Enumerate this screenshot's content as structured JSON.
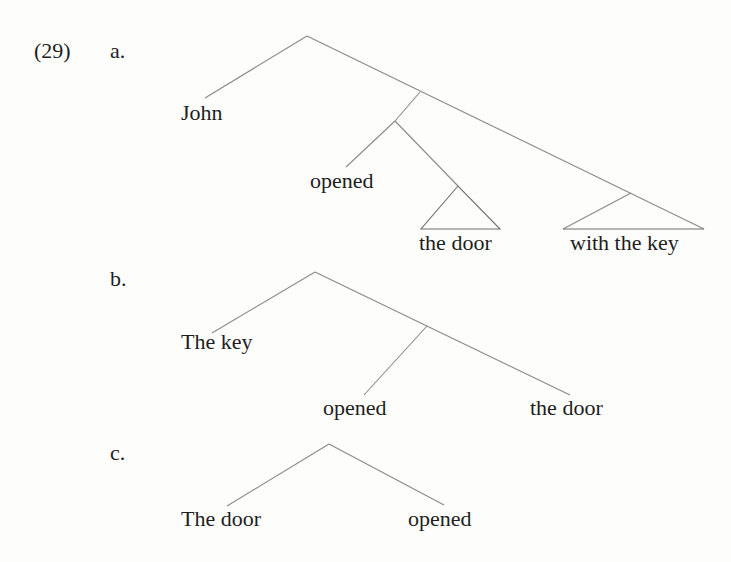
{
  "example": {
    "number": "(29)",
    "items": [
      {
        "label": "a.",
        "words": [
          "John",
          "opened",
          "the door",
          "with the key"
        ]
      },
      {
        "label": "b.",
        "words": [
          "The key",
          "opened",
          "the door"
        ]
      },
      {
        "label": "c.",
        "words": [
          "The door",
          "opened"
        ]
      }
    ]
  },
  "colors": {
    "line": "#8a8a8a",
    "text": "#1e1e1e",
    "background": "#fdfdfb"
  }
}
